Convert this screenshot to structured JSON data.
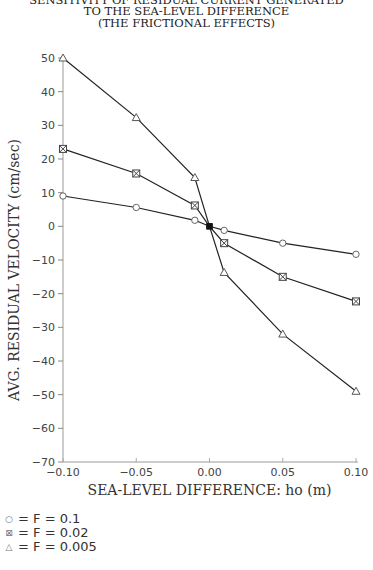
{
  "title": {
    "line1": "SENSITIVITY OF RESIDUAL CURRENT  GENERATED",
    "line2": "TO THE SEA-LEVEL DIFFERENCE",
    "line3": "(THE FRICTIONAL EFFECTS)"
  },
  "legend": [
    {
      "symbol": "○",
      "marker": "circle",
      "text": "= F = 0.1"
    },
    {
      "symbol": "⊠",
      "marker": "square-x",
      "text": "= F = 0.02"
    },
    {
      "symbol": "△",
      "marker": "triangle",
      "text": "= F = 0.005"
    }
  ],
  "chart_data": {
    "type": "line",
    "xlabel": "SEA-LEVEL DIFFERENCE: ho (m)",
    "ylabel": "AVG. RESIDUAL VELOCITY (cm/sec)",
    "x": [
      -0.1,
      -0.05,
      -0.01,
      0.0,
      0.01,
      0.05,
      0.1
    ],
    "series": [
      {
        "name": "F = 0.1",
        "marker": "circle",
        "values": [
          9,
          5.6,
          1.8,
          0,
          -1.2,
          -5,
          -8.3
        ]
      },
      {
        "name": "F = 0.02",
        "marker": "square-x",
        "values": [
          23,
          15.7,
          6.2,
          0,
          -5,
          -15,
          -22.3
        ]
      },
      {
        "name": "F = 0.005",
        "marker": "triangle",
        "values": [
          50,
          32.3,
          14.5,
          0,
          -13.7,
          -32,
          -49
        ]
      }
    ],
    "xlim": [
      -0.1,
      0.1
    ],
    "ylim": [
      -70,
      50
    ],
    "xticks": [
      "-0.10",
      "-0.05",
      "0.00",
      "0.05",
      "0.10"
    ],
    "yticks": [
      "50",
      "40",
      "30",
      "20",
      "10",
      "0",
      "-10",
      "-20",
      "-30",
      "-40",
      "-50",
      "-60",
      "-70"
    ],
    "grid": false,
    "legend_position": "bottom-left, below plot"
  }
}
